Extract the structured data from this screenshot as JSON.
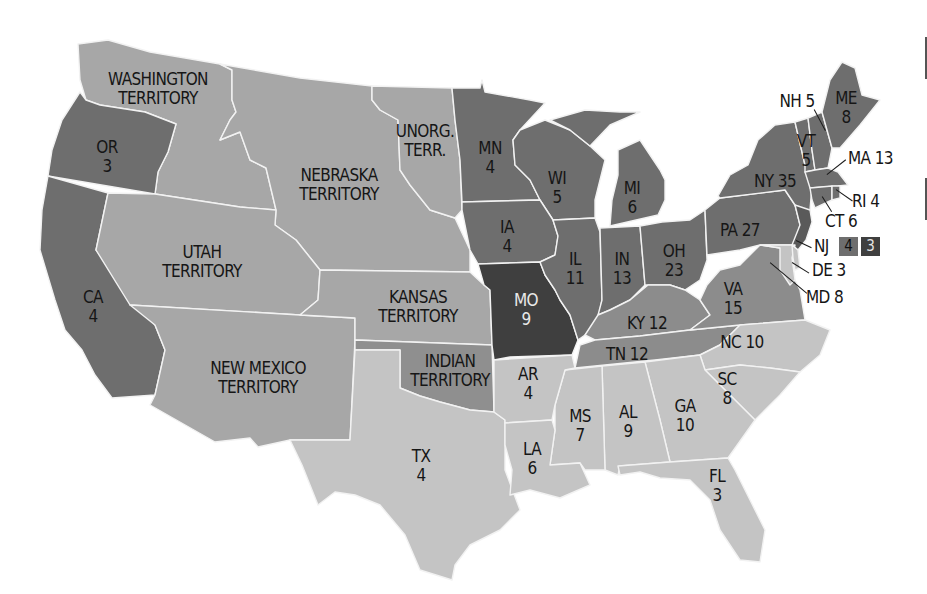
{
  "map": {
    "title": "Electoral votes by state (U.S. map with territories)",
    "shade_colors": {
      "darkest": "#3f3f3f",
      "dark": "#6e6e6e",
      "medium": "#8c8c8c",
      "territory": "#a7a7a7",
      "light": "#c4c4c4"
    },
    "regions": [
      {
        "id": "WA",
        "name": "WASHINGTON",
        "line2": "TERRITORY",
        "votes": null,
        "shade": "territory"
      },
      {
        "id": "OR",
        "name": "OR",
        "votes": "3",
        "shade": "dark"
      },
      {
        "id": "CA",
        "name": "CA",
        "votes": "4",
        "shade": "dark"
      },
      {
        "id": "UT",
        "name": "UTAH",
        "line2": "TERRITORY",
        "votes": null,
        "shade": "territory"
      },
      {
        "id": "NM",
        "name": "NEW MEXICO",
        "line2": "TERRITORY",
        "votes": null,
        "shade": "territory"
      },
      {
        "id": "NE",
        "name": "NEBRASKA",
        "line2": "TERRITORY",
        "votes": null,
        "shade": "territory"
      },
      {
        "id": "UN",
        "name": "UNORG.",
        "line2": "TERR.",
        "votes": null,
        "shade": "territory"
      },
      {
        "id": "KS",
        "name": "KANSAS",
        "line2": "TERRITORY",
        "votes": null,
        "shade": "territory"
      },
      {
        "id": "IT",
        "name": "INDIAN",
        "line2": "TERRITORY",
        "votes": null,
        "shade": "territory"
      },
      {
        "id": "TX",
        "name": "TX",
        "votes": "4",
        "shade": "light"
      },
      {
        "id": "MN",
        "name": "MN",
        "votes": "4",
        "shade": "dark"
      },
      {
        "id": "IA",
        "name": "IA",
        "votes": "4",
        "shade": "dark"
      },
      {
        "id": "MO",
        "name": "MO",
        "votes": "9",
        "shade": "darkest"
      },
      {
        "id": "AR",
        "name": "AR",
        "votes": "4",
        "shade": "light"
      },
      {
        "id": "LA",
        "name": "LA",
        "votes": "6",
        "shade": "light"
      },
      {
        "id": "WI",
        "name": "WI",
        "votes": "5",
        "shade": "dark"
      },
      {
        "id": "IL",
        "name": "IL",
        "votes": "11",
        "shade": "dark"
      },
      {
        "id": "MI",
        "name": "MI",
        "votes": "6",
        "shade": "dark"
      },
      {
        "id": "IN",
        "name": "IN",
        "votes": "13",
        "shade": "dark"
      },
      {
        "id": "OH",
        "name": "OH",
        "votes": "23",
        "shade": "dark"
      },
      {
        "id": "KY",
        "name": "KY",
        "votes": "12",
        "shade": "medium"
      },
      {
        "id": "TN",
        "name": "TN",
        "votes": "12",
        "shade": "medium"
      },
      {
        "id": "MS",
        "name": "MS",
        "votes": "7",
        "shade": "light"
      },
      {
        "id": "AL",
        "name": "AL",
        "votes": "9",
        "shade": "light"
      },
      {
        "id": "GA",
        "name": "GA",
        "votes": "10",
        "shade": "light"
      },
      {
        "id": "FL",
        "name": "FL",
        "votes": "3",
        "shade": "light"
      },
      {
        "id": "SC",
        "name": "SC",
        "votes": "8",
        "shade": "light"
      },
      {
        "id": "NC",
        "name": "NC",
        "votes": "10",
        "shade": "light"
      },
      {
        "id": "VA",
        "name": "VA",
        "votes": "15",
        "shade": "medium"
      },
      {
        "id": "PA",
        "name": "PA",
        "votes": "27",
        "shade": "dark"
      },
      {
        "id": "NY",
        "name": "NY",
        "votes": "35",
        "shade": "dark"
      },
      {
        "id": "VT",
        "name": "VT",
        "votes": "5",
        "shade": "dark"
      },
      {
        "id": "NH",
        "name": "NH",
        "votes": "5",
        "shade": "dark"
      },
      {
        "id": "ME",
        "name": "ME",
        "votes": "8",
        "shade": "dark"
      },
      {
        "id": "MA",
        "name": "MA",
        "votes": "13",
        "shade": "dark"
      },
      {
        "id": "RI",
        "name": "RI",
        "votes": "4",
        "shade": "dark"
      },
      {
        "id": "CT",
        "name": "CT",
        "votes": "6",
        "shade": "dark"
      },
      {
        "id": "NJ",
        "name": "NJ",
        "votes": null,
        "split": [
          "4",
          "3"
        ],
        "shade": "dark"
      },
      {
        "id": "DE",
        "name": "DE",
        "votes": "3",
        "shade": "light"
      },
      {
        "id": "MD",
        "name": "MD",
        "votes": "8",
        "shade": "light"
      }
    ],
    "labels": {
      "WA": "WASHINGTON",
      "WA2": "TERRITORY",
      "OR": "OR",
      "OR_v": "3",
      "CA": "CA",
      "CA_v": "4",
      "UT": "UTAH",
      "UT2": "TERRITORY",
      "NM": "NEW MEXICO",
      "NM2": "TERRITORY",
      "NE": "NEBRASKA",
      "NE2": "TERRITORY",
      "UN": "UNORG.",
      "UN2": "TERR.",
      "KS": "KANSAS",
      "KS2": "TERRITORY",
      "IT": "INDIAN",
      "IT2": "TERRITORY",
      "TX": "TX",
      "TX_v": "4",
      "MN": "MN",
      "MN_v": "4",
      "IA": "IA",
      "IA_v": "4",
      "MO": "MO",
      "MO_v": "9",
      "AR": "AR",
      "AR_v": "4",
      "LA": "LA",
      "LA_v": "6",
      "WI": "WI",
      "WI_v": "5",
      "IL": "IL",
      "IL_v": "11",
      "MI": "MI",
      "MI_v": "6",
      "IN": "IN",
      "IN_v": "13",
      "OH": "OH",
      "OH_v": "23",
      "KY": "KY 12",
      "TN": "TN 12",
      "MS": "MS",
      "MS_v": "7",
      "AL": "AL",
      "AL_v": "9",
      "GA": "GA",
      "GA_v": "10",
      "FL": "FL",
      "FL_v": "3",
      "SC": "SC",
      "SC_v": "8",
      "NC": "NC 10",
      "VA": "VA",
      "VA_v": "15",
      "PA": "PA 27",
      "NY": "NY 35",
      "VT": "VT",
      "VT_v": "5",
      "NH": "NH 5",
      "ME": "ME",
      "ME_v": "8",
      "MA": "MA 13",
      "RI": "RI 4",
      "CT": "CT 6",
      "NJ": "NJ",
      "NJ_a": "4",
      "NJ_b": "3",
      "DE": "DE 3",
      "MD": "MD 8"
    }
  }
}
